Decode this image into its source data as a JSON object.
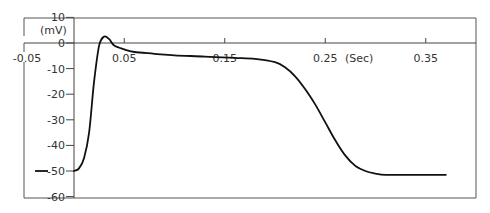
{
  "chart_data": {
    "type": "line",
    "title": "",
    "xlabel": "(Sec)",
    "ylabel": "(mV)",
    "xlim": [
      -0.05,
      0.37
    ],
    "ylim": [
      -60,
      10
    ],
    "grid": false,
    "legend": null,
    "x_ticks": [
      -0.05,
      0.05,
      0.15,
      0.25,
      0.35
    ],
    "x_tick_labels": [
      "-0.05",
      "0.05",
      "0.15",
      "0.25",
      "0.35"
    ],
    "y_ticks": [
      10,
      0,
      -10,
      -20,
      -30,
      -40,
      -50,
      -60
    ],
    "y_tick_labels": [
      "10",
      "0",
      "-10",
      "-20",
      "-30",
      "-40",
      "-50",
      "-60"
    ],
    "series": [
      {
        "name": "Action potential",
        "x": [
          -0.04,
          -0.025,
          0.0,
          0.005,
          0.01,
          0.015,
          0.02,
          0.025,
          0.03,
          0.035,
          0.04,
          0.05,
          0.06,
          0.08,
          0.1,
          0.13,
          0.16,
          0.18,
          0.2,
          0.21,
          0.22,
          0.23,
          0.24,
          0.25,
          0.26,
          0.27,
          0.28,
          0.29,
          0.3,
          0.31,
          0.33,
          0.35,
          0.37
        ],
        "values": [
          -50,
          -50,
          -50,
          -49,
          -45,
          -35,
          -15,
          -1,
          2.5,
          1.5,
          -1,
          -2.5,
          -3.5,
          -4.2,
          -4.8,
          -5.3,
          -5.8,
          -6.2,
          -7.5,
          -9.5,
          -13,
          -18,
          -24,
          -31,
          -38,
          -44,
          -48,
          -50,
          -51,
          -51.5,
          -51.5,
          -51.5,
          -51.5
        ]
      }
    ]
  },
  "labels": {
    "y_unit": "(mV)",
    "x_unit": "(Sec)"
  }
}
